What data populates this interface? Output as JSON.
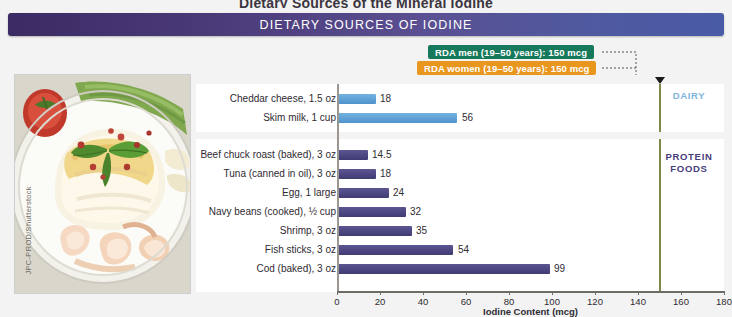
{
  "top_title": "Dietary Sources of the Mineral Iodine",
  "banner": {
    "title": "DIETARY SOURCES OF IODINE"
  },
  "rda": {
    "men_label": "RDA men (19–50 years): 150 mcg",
    "women_label": "RDA women (19–50 years): 150 mcg",
    "value": 150,
    "line_color": "#7d8a4e",
    "men_color": "#17795c",
    "women_color": "#e8961e"
  },
  "photo": {
    "credit": "JPC-PROD/Shutterstock",
    "description": "Baked white fish fillet with basil, peppercorns, shrimp, roasted tomato and green beans on a plate"
  },
  "groups": {
    "dairy_label": "DAIRY",
    "protein_label": "PROTEIN\nFOODS",
    "protein_label_line1": "PROTEIN",
    "protein_label_line2": "FOODS",
    "dairy_color": "#7fb4dd",
    "protein_color": "#46407c"
  },
  "chart_data": {
    "type": "bar",
    "orientation": "horizontal",
    "title": "DIETARY SOURCES OF IODINE",
    "xlabel": "Iodine Content (mcg)",
    "ylabel": "",
    "xlim": [
      0,
      180
    ],
    "xticks": [
      0,
      20,
      40,
      60,
      80,
      100,
      120,
      140,
      160,
      180
    ],
    "grid": false,
    "legend": "none",
    "reference_lines": [
      {
        "label": "RDA men (19–50 years): 150 mcg",
        "value": 150,
        "color": "#17795c"
      },
      {
        "label": "RDA women (19–50 years): 150 mcg",
        "value": 150,
        "color": "#e8961e"
      }
    ],
    "series": [
      {
        "name": "DAIRY",
        "color": "#5b9bd5",
        "categories": [
          "Cheddar cheese, 1.5 oz",
          "Skim milk, 1 cup"
        ],
        "values": [
          18,
          56
        ]
      },
      {
        "name": "PROTEIN FOODS",
        "color": "#4a4580",
        "categories": [
          "Beef chuck roast (baked), 3 oz",
          "Tuna (canned in oil), 3 oz",
          "Egg, 1 large",
          "Navy beans (cooked), ½ cup",
          "Shrimp, 3 oz",
          "Fish sticks, 3 oz",
          "Cod (baked), 3 oz"
        ],
        "values": [
          14.5,
          18,
          24,
          32,
          35,
          54,
          99
        ]
      }
    ]
  }
}
